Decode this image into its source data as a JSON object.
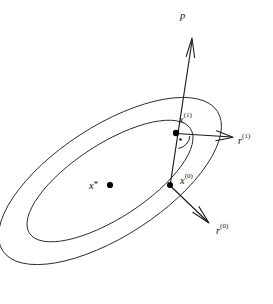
{
  "figure": {
    "kind": "conjugate-direction-contour-diagram",
    "width": 273,
    "height": 304,
    "background_color": "#ffffff",
    "stroke_color": "#1a1a1a",
    "contour_color": "#2b2b2b"
  },
  "labels": {
    "p": "p",
    "x_star_base": "x",
    "x_star_mark": "*",
    "x1_base": "x",
    "x1_sup": "(1)",
    "x0_base": "x",
    "x0_sup": "(0)",
    "r1_base": "r",
    "r1_sup": "(1)",
    "r0_base": "r",
    "r0_sup": "(0)"
  },
  "chart_data": {
    "type": "scatter",
    "title": "",
    "xlabel": "",
    "ylabel": "",
    "grid": false,
    "legend": null,
    "contours": [
      {
        "name": "outer-level-set",
        "center": [
          110,
          181
        ],
        "semi_major": 128,
        "semi_minor": 55,
        "rotation_deg": -33
      },
      {
        "name": "inner-level-set",
        "center": [
          110,
          181
        ],
        "semi_major": 96,
        "semi_minor": 37,
        "rotation_deg": -33
      }
    ],
    "points": [
      {
        "name": "x-star",
        "label": "x*",
        "x": 110,
        "y": 185
      },
      {
        "name": "x-1",
        "label": "x^(1)",
        "x": 176,
        "y": 133
      },
      {
        "name": "x-0",
        "label": "x^(0)",
        "x": 170,
        "y": 185
      }
    ],
    "vectors": [
      {
        "name": "p",
        "label": "p",
        "from": [
          170,
          185
        ],
        "to": [
          192,
          38
        ]
      },
      {
        "name": "r-1",
        "label": "r^(1)",
        "from": [
          176,
          133
        ],
        "to": [
          233,
          137
        ]
      },
      {
        "name": "r-0",
        "label": "r^(0)",
        "from": [
          170,
          185
        ],
        "to": [
          209,
          223
        ]
      }
    ],
    "annotations": [
      {
        "name": "right-angle-marker",
        "at": [
          176,
          133
        ],
        "kind": "arc-with-center-dot"
      }
    ]
  }
}
